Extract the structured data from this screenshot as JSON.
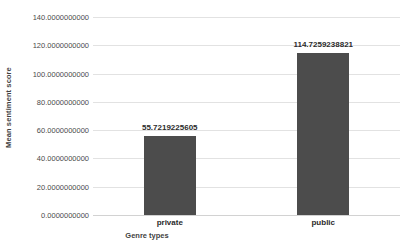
{
  "chart_data": {
    "type": "bar",
    "title": "",
    "xlabel": "Genre types",
    "ylabel": "Mean sentiment score",
    "categories": [
      "private",
      "public"
    ],
    "values": [
      55.7219225605,
      114.7259238821
    ],
    "value_labels": [
      "55.7219225605",
      "114.7259238821"
    ],
    "ylim": [
      0,
      140
    ],
    "y_ticks": [
      0,
      20,
      40,
      60,
      80,
      100,
      120,
      140
    ],
    "y_tick_labels": [
      "0.0000000000",
      "20.0000000000",
      "40.0000000000",
      "60.0000000000",
      "80.0000000000",
      "100.0000000000",
      "120.0000000000",
      "140.0000000000"
    ],
    "grid": true,
    "legend": false,
    "legend_position": "none",
    "bar_color": "#4c4c4c",
    "gridline_color": "#e2e2e2",
    "background_color": "#ffffff"
  }
}
